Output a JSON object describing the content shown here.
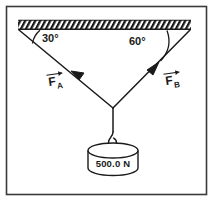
{
  "figure": {
    "border_color": "#3a3a3a",
    "stroke_color": "#1a1a1a",
    "background_color": "#ffffff"
  },
  "ceiling": {
    "name": "hatched ceiling support",
    "hatch_label": "ceiling-hatching"
  },
  "angles": [
    {
      "id": "left",
      "label": "30°",
      "value": 30,
      "unit": "degrees",
      "measured_from": "ceiling"
    },
    {
      "id": "right",
      "label": "60°",
      "value": 60,
      "unit": "degrees",
      "measured_from": "ceiling"
    }
  ],
  "vectors": [
    {
      "id": "A",
      "symbol": "F",
      "subscript": "A",
      "label": "F_A",
      "arrow": "vector-overbar"
    },
    {
      "id": "B",
      "symbol": "F",
      "subscript": "B",
      "label": "F_B",
      "arrow": "vector-overbar"
    }
  ],
  "weight": {
    "label": "500.0 N",
    "magnitude": "500.0",
    "unit": "N",
    "shape": "cylinder"
  },
  "hook": {
    "name": "hook connecting rope to weight"
  }
}
